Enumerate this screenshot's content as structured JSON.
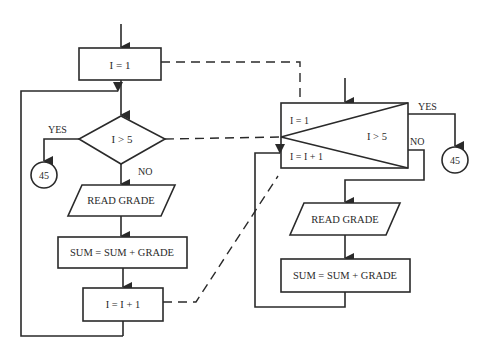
{
  "colors": {
    "ink": "#2a2a2a",
    "background": "#ffffff"
  },
  "flowchart": {
    "init": "I = 1",
    "condition": "I > 5",
    "yes": "YES",
    "no": "NO",
    "connector": "45",
    "read": "READ GRADE",
    "accumulate": "SUM = SUM + GRADE",
    "increment": "I = I + 1"
  },
  "loop_symbol": {
    "init": "I = 1",
    "condition": "I > 5",
    "increment": "I = I + 1",
    "yes": "YES",
    "no": "NO",
    "connector": "45",
    "read": "READ GRADE",
    "accumulate": "SUM = SUM + GRADE"
  }
}
